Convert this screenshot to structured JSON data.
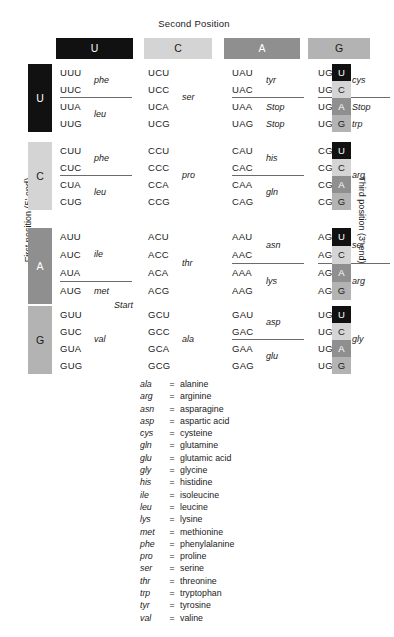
{
  "title": "Second Position",
  "axis": {
    "first_position": "First position (5'-end)",
    "third_position": "Third position (3'-end)"
  },
  "colors": {
    "U": "#111111",
    "C": "#d4d4d4",
    "A": "#8f8f8f",
    "G": "#b3b3b3",
    "U_text": "#ffffff",
    "C_text": "#1a1a1a",
    "A_text": "#ffffff",
    "G_text": "#1a1a1a",
    "divider": "#6b6b6b",
    "background": "#ffffff"
  },
  "column_headers": [
    {
      "label": "U",
      "bg": "#111111",
      "fg": "#ffffff"
    },
    {
      "label": "C",
      "bg": "#d4d4d4",
      "fg": "#1a1a1a"
    },
    {
      "label": "A",
      "bg": "#8f8f8f",
      "fg": "#ffffff"
    },
    {
      "label": "G",
      "bg": "#b3b3b3",
      "fg": "#1a1a1a"
    }
  ],
  "third_position_chips": [
    {
      "label": "U",
      "bg": "#111111",
      "fg": "#ffffff"
    },
    {
      "label": "C",
      "bg": "#d4d4d4",
      "fg": "#1a1a1a"
    },
    {
      "label": "A",
      "bg": "#8f8f8f",
      "fg": "#ffffff"
    },
    {
      "label": "G",
      "bg": "#b3b3b3",
      "fg": "#1a1a1a"
    }
  ],
  "rows": [
    {
      "label": "U",
      "bg": "#111111",
      "fg": "#ffffff",
      "cells": [
        {
          "codons": [
            "UUU",
            "UUC",
            "UUA",
            "UUG"
          ],
          "groups": [
            {
              "aa": "phe",
              "start": 0,
              "size": 2
            },
            {
              "aa": "leu",
              "start": 2,
              "size": 2
            }
          ],
          "divider_after": 2
        },
        {
          "codons": [
            "UCU",
            "UCC",
            "UCA",
            "UCG"
          ],
          "groups": [
            {
              "aa": "ser",
              "start": 0,
              "size": 4
            }
          ],
          "divider_after": null
        },
        {
          "codons": [
            "UAU",
            "UAC",
            "UAA",
            "UAG"
          ],
          "groups": [
            {
              "aa": "tyr",
              "start": 0,
              "size": 2
            }
          ],
          "inline": {
            "2": "Stop",
            "3": "Stop"
          },
          "divider_after": 2
        },
        {
          "codons": [
            "UGU",
            "UGC",
            "UGA",
            "UGG"
          ],
          "groups": [
            {
              "aa": "cys",
              "start": 0,
              "size": 2
            }
          ],
          "inline": {
            "2": "Stop",
            "3": "trp"
          },
          "divider_after": 2
        }
      ]
    },
    {
      "label": "C",
      "bg": "#d4d4d4",
      "fg": "#1a1a1a",
      "cells": [
        {
          "codons": [
            "CUU",
            "CUC",
            "CUA",
            "CUG"
          ],
          "groups": [
            {
              "aa": "phe",
              "start": 0,
              "size": 2
            },
            {
              "aa": "leu",
              "start": 2,
              "size": 2
            }
          ],
          "divider_after": 2
        },
        {
          "codons": [
            "CCU",
            "CCC",
            "CCA",
            "CCG"
          ],
          "groups": [
            {
              "aa": "pro",
              "start": 0,
              "size": 4
            }
          ],
          "divider_after": null
        },
        {
          "codons": [
            "CAU",
            "CAC",
            "CAA",
            "CAG"
          ],
          "groups": [
            {
              "aa": "his",
              "start": 0,
              "size": 2
            },
            {
              "aa": "gln",
              "start": 2,
              "size": 2
            }
          ],
          "divider_after": 2
        },
        {
          "codons": [
            "CGU",
            "CGC",
            "CGA",
            "CGG"
          ],
          "groups": [
            {
              "aa": "arg",
              "start": 0,
              "size": 4
            }
          ],
          "divider_after": null
        }
      ]
    },
    {
      "label": "A",
      "bg": "#8f8f8f",
      "fg": "#ffffff",
      "cells": [
        {
          "codons": [
            "AUU",
            "AUC",
            "AUA",
            "AUG"
          ],
          "groups": [
            {
              "aa": "ile",
              "start": 0,
              "size": 3
            }
          ],
          "inline": {
            "3": "met"
          },
          "extra_line": "Start",
          "divider_after": 3
        },
        {
          "codons": [
            "ACU",
            "ACC",
            "ACA",
            "ACG"
          ],
          "groups": [
            {
              "aa": "thr",
              "start": 0,
              "size": 4
            }
          ],
          "divider_after": null
        },
        {
          "codons": [
            "AAU",
            "AAC",
            "AAA",
            "AAG"
          ],
          "groups": [
            {
              "aa": "asn",
              "start": 0,
              "size": 2
            },
            {
              "aa": "lys",
              "start": 2,
              "size": 2
            }
          ],
          "divider_after": 2
        },
        {
          "codons": [
            "AGU",
            "AGC",
            "AGA",
            "AGG"
          ],
          "groups": [
            {
              "aa": "ser",
              "start": 0,
              "size": 2
            },
            {
              "aa": "arg",
              "start": 2,
              "size": 2
            }
          ],
          "divider_after": 2
        }
      ]
    },
    {
      "label": "G",
      "bg": "#b3b3b3",
      "fg": "#1a1a1a",
      "cells": [
        {
          "codons": [
            "GUU",
            "GUC",
            "GUA",
            "GUG"
          ],
          "groups": [
            {
              "aa": "val",
              "start": 0,
              "size": 4
            }
          ],
          "divider_after": null
        },
        {
          "codons": [
            "GCU",
            "GCC",
            "GCA",
            "GCG"
          ],
          "groups": [
            {
              "aa": "ala",
              "start": 0,
              "size": 4
            }
          ],
          "divider_after": null
        },
        {
          "codons": [
            "GAU",
            "GAC",
            "GAA",
            "GAG"
          ],
          "groups": [
            {
              "aa": "asp",
              "start": 0,
              "size": 2
            },
            {
              "aa": "glu",
              "start": 2,
              "size": 2
            }
          ],
          "divider_after": 2
        },
        {
          "codons": [
            "UGU",
            "UGC",
            "UGA",
            "UGG"
          ],
          "groups": [
            {
              "aa": "gly",
              "start": 0,
              "size": 4
            }
          ],
          "divider_after": null
        }
      ]
    }
  ],
  "legend": {
    "separator": "=",
    "entries": [
      {
        "abbr": "ala",
        "name": "alanine"
      },
      {
        "abbr": "arg",
        "name": "arginine"
      },
      {
        "abbr": "asn",
        "name": "asparagine"
      },
      {
        "abbr": "asp",
        "name": "aspartic acid"
      },
      {
        "abbr": "cys",
        "name": "cysteine"
      },
      {
        "abbr": "gln",
        "name": "glutamine"
      },
      {
        "abbr": "glu",
        "name": "glutamic acid"
      },
      {
        "abbr": "gly",
        "name": "glycine"
      },
      {
        "abbr": "his",
        "name": "histidine"
      },
      {
        "abbr": "ile",
        "name": "isoleucine"
      },
      {
        "abbr": "leu",
        "name": "leucine"
      },
      {
        "abbr": "lys",
        "name": "lysine"
      },
      {
        "abbr": "met",
        "name": "methionine"
      },
      {
        "abbr": "phe",
        "name": "phenylalanine"
      },
      {
        "abbr": "pro",
        "name": "proline"
      },
      {
        "abbr": "ser",
        "name": "serine"
      },
      {
        "abbr": "thr",
        "name": "threonine"
      },
      {
        "abbr": "trp",
        "name": "tryptophan"
      },
      {
        "abbr": "tyr",
        "name": "tyrosine"
      },
      {
        "abbr": "val",
        "name": "valine"
      }
    ]
  }
}
